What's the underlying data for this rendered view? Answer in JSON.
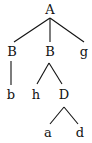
{
  "diagram": {
    "type": "tree",
    "nodes": [
      {
        "id": "n0",
        "label": "A"
      },
      {
        "id": "n1",
        "label": "B"
      },
      {
        "id": "n2",
        "label": "B"
      },
      {
        "id": "n3",
        "label": "g"
      },
      {
        "id": "n4",
        "label": "b"
      },
      {
        "id": "n5",
        "label": "h"
      },
      {
        "id": "n6",
        "label": "D"
      },
      {
        "id": "n7",
        "label": "a"
      },
      {
        "id": "n8",
        "label": "d"
      }
    ],
    "edges": [
      {
        "from": "n0",
        "to": "n1"
      },
      {
        "from": "n0",
        "to": "n2"
      },
      {
        "from": "n0",
        "to": "n3"
      },
      {
        "from": "n1",
        "to": "n4"
      },
      {
        "from": "n2",
        "to": "n5"
      },
      {
        "from": "n2",
        "to": "n6"
      },
      {
        "from": "n6",
        "to": "n7"
      },
      {
        "from": "n6",
        "to": "n8"
      }
    ]
  }
}
